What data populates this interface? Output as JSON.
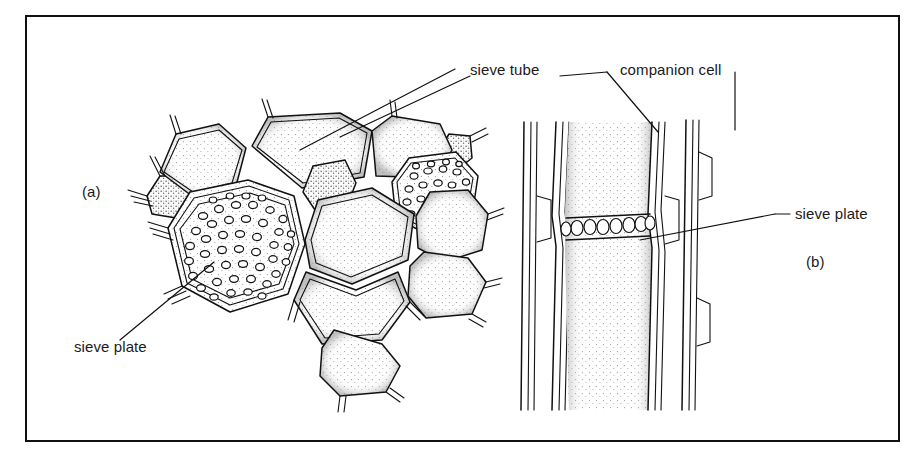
{
  "figure": {
    "kind": "biology-line-drawing",
    "frame_border_color": "#111111",
    "background_color": "#ffffff",
    "ink_color": "#1a1a1a",
    "panels": [
      {
        "id": "panel-a",
        "label": "(a)",
        "view": "transverse-section"
      },
      {
        "id": "panel-b",
        "label": "(b)",
        "view": "longitudinal-section"
      }
    ],
    "labels": [
      {
        "id": "sieve-tube",
        "text": "sieve tube",
        "panel": "a",
        "leader": "diagonal-down-left"
      },
      {
        "id": "companion-cell",
        "text": "companion cell",
        "panel": "a",
        "leader": "diagonal-down-left"
      },
      {
        "id": "sieve-plate-a",
        "text": "sieve plate",
        "panel": "a",
        "leader": "diagonal-up-right"
      },
      {
        "id": "sieve-plate-b",
        "text": "sieve plate",
        "panel": "b",
        "leader": "diagonal-down-left"
      }
    ],
    "panel_a": {
      "cell_count": 11,
      "sieve_tube_cells_with_plate": 2,
      "pores_per_plate": [
        46,
        26
      ],
      "companion_cells_shaded": 3
    },
    "panel_b": {
      "tube_columns": 2,
      "sieve_plates": 1,
      "sieve_plate_pores": 9,
      "companion_cell_strips": 2
    }
  }
}
